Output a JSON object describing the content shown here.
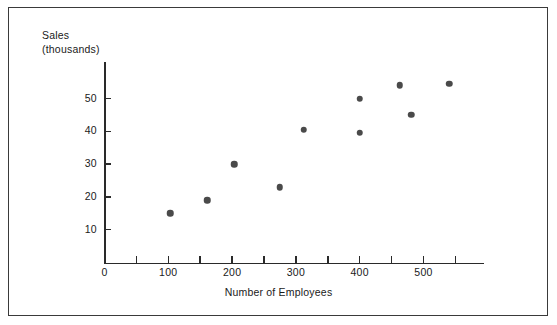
{
  "chart_data": {
    "type": "scatter",
    "title": "",
    "xlabel": "Number of Employees",
    "ylabel_line1": "Sales",
    "ylabel_line2": "(thousands)",
    "xlim": [
      0,
      595
    ],
    "ylim": [
      0,
      61
    ],
    "grid": false,
    "legend": null,
    "x_ticks": [
      {
        "value": 0,
        "label": "0",
        "major": true
      },
      {
        "value": 50,
        "label": "",
        "major": false
      },
      {
        "value": 100,
        "label": "100",
        "major": true
      },
      {
        "value": 150,
        "label": "",
        "major": false
      },
      {
        "value": 200,
        "label": "200",
        "major": true
      },
      {
        "value": 250,
        "label": "",
        "major": false
      },
      {
        "value": 300,
        "label": "300",
        "major": true
      },
      {
        "value": 350,
        "label": "",
        "major": false
      },
      {
        "value": 400,
        "label": "400",
        "major": true
      },
      {
        "value": 450,
        "label": "",
        "major": false
      },
      {
        "value": 500,
        "label": "500",
        "major": true
      },
      {
        "value": 550,
        "label": "",
        "major": false
      }
    ],
    "y_ticks": [
      {
        "value": 10,
        "label": "10"
      },
      {
        "value": 20,
        "label": "20"
      },
      {
        "value": 30,
        "label": "30"
      },
      {
        "value": 40,
        "label": "40"
      },
      {
        "value": 50,
        "label": "50"
      }
    ],
    "points": [
      {
        "x": 103,
        "y": 15
      },
      {
        "x": 161,
        "y": 19
      },
      {
        "x": 203,
        "y": 30
      },
      {
        "x": 275,
        "y": 23
      },
      {
        "x": 312,
        "y": 40.5
      },
      {
        "x": 400,
        "y": 50
      },
      {
        "x": 400,
        "y": 39.5
      },
      {
        "x": 463,
        "y": 54
      },
      {
        "x": 481,
        "y": 45
      },
      {
        "x": 540,
        "y": 54.5
      }
    ],
    "marker_color": "#4a4a4a",
    "axis_color": "#2a2a2a",
    "frame_color": "#3a3a3a",
    "background_color": "#ffffff"
  }
}
